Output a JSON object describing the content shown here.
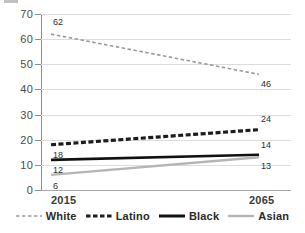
{
  "chart_data": {
    "type": "line",
    "title": "",
    "xlabel": "",
    "ylabel": "",
    "x": [
      2015,
      2065
    ],
    "categories": [
      "2015",
      "2065"
    ],
    "ylim": [
      0,
      70
    ],
    "yticks": [
      0,
      10,
      20,
      30,
      40,
      50,
      60,
      70
    ],
    "ytick_labels": [
      "0",
      "10",
      "20",
      "30",
      "40",
      "50",
      "60",
      "70"
    ],
    "xtick_labels": [
      "2015",
      "2065"
    ],
    "grid": true,
    "legend_position": "bottom",
    "series": [
      {
        "name": "White",
        "values": [
          62,
          46
        ],
        "point_labels": [
          "62",
          "46"
        ],
        "color": "#9a9a9a",
        "style": "dashed",
        "width": 1.6
      },
      {
        "name": "Latino",
        "values": [
          18,
          24
        ],
        "point_labels": [
          "18",
          "24"
        ],
        "color": "#1c1c1c",
        "style": "dashed",
        "width": 3.2
      },
      {
        "name": "Black",
        "values": [
          12,
          14
        ],
        "point_labels": [
          "12",
          "14"
        ],
        "color": "#111111",
        "style": "solid",
        "width": 2.6
      },
      {
        "name": "Asian",
        "values": [
          6,
          13
        ],
        "point_labels": [
          "6",
          "13"
        ],
        "color": "#b5b5b5",
        "style": "solid",
        "width": 2.4
      }
    ]
  },
  "axis": {
    "y_labels": [
      "70",
      "60",
      "50",
      "40",
      "30",
      "20",
      "10",
      "0"
    ],
    "x_first": "2015",
    "x_last": "2065"
  },
  "legend": {
    "items": [
      {
        "label": "White"
      },
      {
        "label": "Latino"
      },
      {
        "label": "Black"
      },
      {
        "label": "Asian"
      }
    ]
  },
  "colors": {
    "grid": "#dcdcdc",
    "axis": "#8c8c8c",
    "text": "#3b3b3b",
    "white_series": "#9a9a9a",
    "latino_series": "#1c1c1c",
    "black_series": "#111111",
    "asian_series": "#b5b5b5"
  }
}
